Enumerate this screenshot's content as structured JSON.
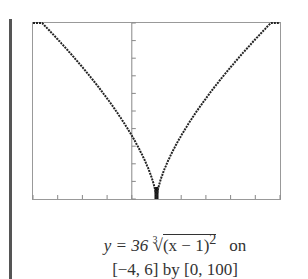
{
  "chart_data": {
    "type": "line",
    "title": "",
    "function": "y = 36 * cbrt((x - 1)^2)",
    "xlabel": "",
    "ylabel": "",
    "xlim": [
      -4,
      6
    ],
    "ylim": [
      0,
      100
    ],
    "x_ticks": [
      -4,
      -3,
      -2,
      -1,
      0,
      1,
      2,
      3,
      4,
      5,
      6
    ],
    "y_ticks": [
      0,
      10,
      20,
      30,
      40,
      50,
      60,
      70,
      80,
      90,
      100
    ],
    "grid": false,
    "legend": null,
    "series": [
      {
        "name": "y = 36 (x-1)^(2/3)",
        "x": [
          -4,
          -3,
          -2,
          -1,
          0,
          0.5,
          1,
          1.5,
          2,
          3,
          4,
          5,
          6
        ],
        "y": [
          105.3,
          90.7,
          74.9,
          57.1,
          36,
          22.7,
          0,
          22.7,
          36,
          57.1,
          74.9,
          90.7,
          105.3
        ]
      }
    ],
    "colors": {
      "curve": "#222222",
      "frame": "#999999",
      "axis": "#888888"
    }
  },
  "caption": {
    "line1_prefix": "y = 36",
    "root_index": "3",
    "radicand": "(x − 1)",
    "exponent": "2",
    "line1_suffix": "on",
    "line2": "[−4, 6] by [0, 100]"
  }
}
